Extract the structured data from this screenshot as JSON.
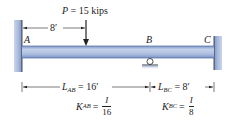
{
  "load": {
    "label": "P = 15 kips",
    "symbol": "P",
    "value": "15 kips",
    "distance_from_A": "8′"
  },
  "points": {
    "A": "A",
    "B": "B",
    "C": "C"
  },
  "spans": {
    "AB": {
      "length_label": "L",
      "length_sub": "AB",
      "length_value": "= 16′",
      "stiffness_label": "K",
      "stiffness_sub": "AB",
      "stiffness_eq": "=",
      "stiffness_num": "I",
      "stiffness_den": "16"
    },
    "BC": {
      "length_label": "L",
      "length_sub": "BC",
      "length_value": "= 8′",
      "stiffness_label": "K",
      "stiffness_sub": "BC",
      "stiffness_eq": "=",
      "stiffness_num": "I",
      "stiffness_den": "8"
    }
  },
  "supports": {
    "A": "fixed-wall",
    "B": "roller",
    "C": "fixed-wall"
  },
  "colors": {
    "beam_fill": "#a9bbdc",
    "beam_edge": "#5d7bb0",
    "wall_fill": "#9fb3d8",
    "wall_shadow": "#7d95c5",
    "line": "#222222"
  }
}
